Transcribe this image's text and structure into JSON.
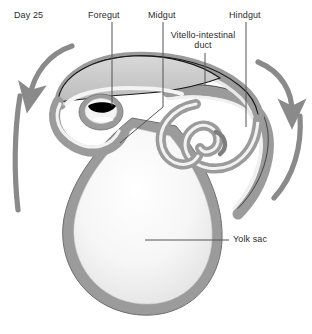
{
  "figure": {
    "caption_day": "Day 25",
    "title_implicit": "Embryonic gut tube and yolk sac at Day 25",
    "background_color": "#ffffff",
    "gut_wall_color": "#9b9b9b",
    "gut_wall_dark_color": "#7d7d7d",
    "gut_lumen_color": "#f2f2f2",
    "foregut_shade_color": "#c9c9c9",
    "arrow_color": "#8a8a8a",
    "outline_color": "#1a1a1a",
    "leader_line_color": "#555555",
    "text_color": "#2b2b2b",
    "stoma_dark_color": "#000000"
  },
  "labels": [
    {
      "id": "day",
      "text": "Day 25",
      "x": 14,
      "y": 10,
      "leader": false
    },
    {
      "id": "foregut",
      "text": "Foregut",
      "x": 88,
      "y": 10,
      "leader": true,
      "leader_x": 112,
      "leader_y1": 22,
      "leader_y2": 106
    },
    {
      "id": "midgut",
      "text": "Midgut",
      "x": 148,
      "y": 10,
      "leader": true,
      "leader_x": 163,
      "leader_y1": 22,
      "leader_y2": 107
    },
    {
      "id": "hindgut",
      "text": "Hindgut",
      "x": 229,
      "y": 10,
      "leader": true,
      "leader_x": 246,
      "leader_y1": 22,
      "leader_y2": 127
    },
    {
      "id": "vitello-intestinal-duct",
      "text": "Vitello-intestinal\nduct",
      "line1": "Vitello-intestinal",
      "line2": "duct",
      "x": 165,
      "y": 30,
      "width": 76,
      "leader": true,
      "leader_x": 205,
      "leader_y1": 53,
      "leader_y2": 86
    },
    {
      "id": "yolk-sac",
      "text": "Yolk sac",
      "x": 233,
      "y": 234,
      "leader": true,
      "leader_x1": 145,
      "leader_x2": 229,
      "leader_y": 240
    }
  ],
  "annotations": {
    "midgut_diagonal_leader": {
      "x1": 163,
      "y1": 107,
      "x2": 120,
      "y2": 143
    }
  },
  "arrows": [
    {
      "id": "left-rotation-arrow",
      "direction": "counterclockwise-down-left",
      "color": "#8a8a8a"
    },
    {
      "id": "right-rotation-arrow",
      "direction": "clockwise-down-right",
      "color": "#8a8a8a"
    }
  ],
  "structures": [
    {
      "id": "foregut-region",
      "name": "Foregut"
    },
    {
      "id": "midgut-region",
      "name": "Midgut"
    },
    {
      "id": "hindgut-region",
      "name": "Hindgut"
    },
    {
      "id": "vitelline-duct",
      "name": "Vitello-intestinal duct"
    },
    {
      "id": "yolk-sac-body",
      "name": "Yolk sac"
    },
    {
      "id": "stomodeum-slit",
      "name": "dark oral slit"
    }
  ]
}
